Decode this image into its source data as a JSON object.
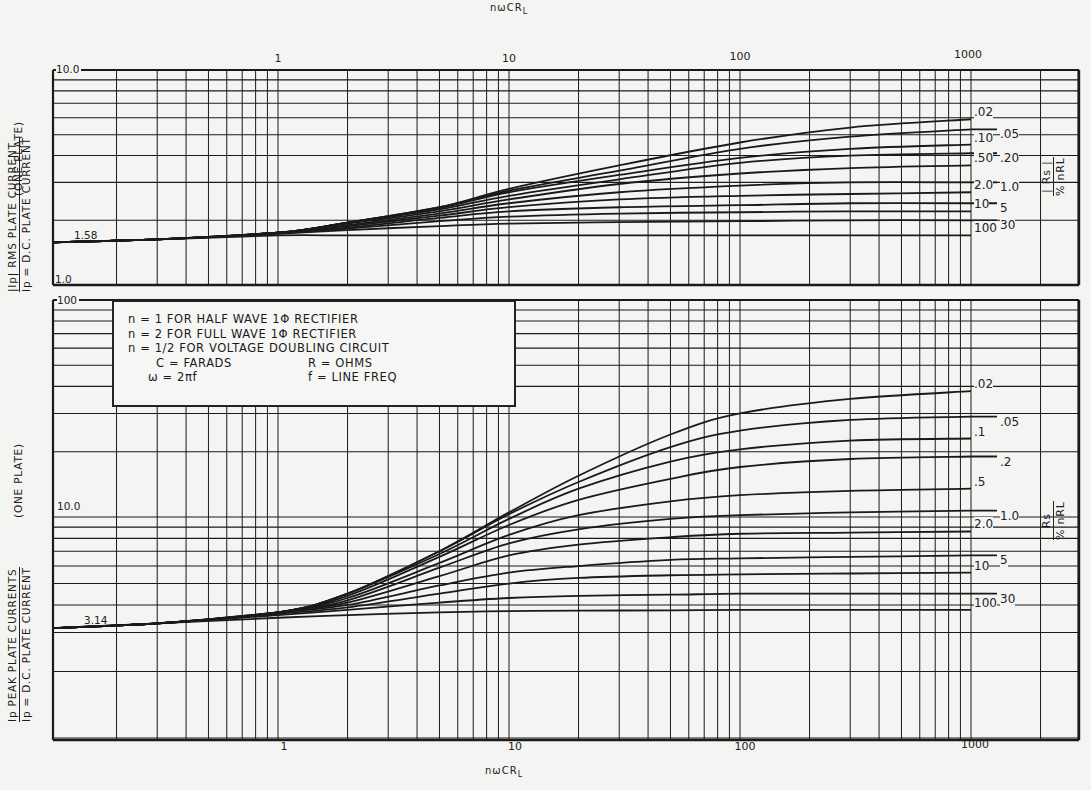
{
  "chart_data": [
    {
      "type": "line",
      "panel": "top",
      "title": "",
      "xlabel": "nωCR_L",
      "ylabel": "|Ip| / Ip = RMS PLATE CURRENT / D.C. PLATE CURRENT (ONE PLATE)",
      "xscale": "log",
      "yscale": "log",
      "xlim": [
        0.1,
        3000
      ],
      "ylim": [
        1.0,
        10.0
      ],
      "x_ticks": [
        "1",
        "10",
        "100",
        "1000"
      ],
      "y_tick_labels": [
        "10.0",
        "1.0"
      ],
      "annotations": [
        {
          "text": "1.58",
          "value": 1.58
        }
      ],
      "legend_title": "% |Rs| / nRL",
      "grid": true,
      "x": [
        0.1,
        0.3,
        1,
        2,
        5,
        10,
        30,
        100,
        300,
        1000
      ],
      "series": [
        {
          "name": ".02",
          "values": [
            1.58,
            1.63,
            1.75,
            1.95,
            2.3,
            2.8,
            3.6,
            4.6,
            5.4,
            5.9
          ]
        },
        {
          "name": ".05",
          "values": [
            1.58,
            1.63,
            1.75,
            1.95,
            2.3,
            2.75,
            3.4,
            4.3,
            4.9,
            5.3
          ]
        },
        {
          "name": ".10",
          "values": [
            1.58,
            1.63,
            1.75,
            1.95,
            2.28,
            2.7,
            3.25,
            3.9,
            4.3,
            4.5
          ]
        },
        {
          "name": ".20",
          "values": [
            1.58,
            1.63,
            1.75,
            1.95,
            2.25,
            2.6,
            3.1,
            3.7,
            4.0,
            4.1
          ]
        },
        {
          "name": ".50",
          "values": [
            1.58,
            1.63,
            1.75,
            1.93,
            2.2,
            2.5,
            2.95,
            3.3,
            3.5,
            3.6
          ]
        },
        {
          "name": "1.0",
          "values": [
            1.58,
            1.63,
            1.75,
            1.9,
            2.15,
            2.4,
            2.7,
            2.9,
            3.0,
            3.0
          ]
        },
        {
          "name": "2.0",
          "values": [
            1.58,
            1.63,
            1.75,
            1.88,
            2.1,
            2.3,
            2.5,
            2.6,
            2.65,
            2.7
          ]
        },
        {
          "name": "5",
          "values": [
            1.58,
            1.63,
            1.75,
            1.85,
            2.05,
            2.2,
            2.3,
            2.35,
            2.4,
            2.4
          ]
        },
        {
          "name": "10",
          "values": [
            1.58,
            1.63,
            1.75,
            1.83,
            1.98,
            2.08,
            2.15,
            2.18,
            2.2,
            2.2
          ]
        },
        {
          "name": "30",
          "values": [
            1.58,
            1.63,
            1.73,
            1.8,
            1.88,
            1.93,
            1.96,
            1.98,
            2.0,
            2.0
          ]
        },
        {
          "name": "100",
          "values": [
            1.58,
            1.63,
            1.7,
            1.7,
            1.7,
            1.7,
            1.7,
            1.7,
            1.7,
            1.7
          ]
        }
      ]
    },
    {
      "type": "line",
      "panel": "bottom",
      "title": "",
      "xlabel": "nωCR_L",
      "ylabel": "Ip / Ip = PEAK PLATE CURRENTS / D.C. PLATE CURRENT (ONE PLATE)",
      "xscale": "log",
      "yscale": "log",
      "xlim": [
        0.1,
        3000
      ],
      "ylim": [
        1.0,
        100
      ],
      "x_ticks": [
        "1",
        "10",
        "100",
        "1000"
      ],
      "y_tick_labels": [
        "100",
        "10.0"
      ],
      "annotations": [
        {
          "text": "3.14",
          "value": 3.14
        }
      ],
      "legend_title": "% Rs / nRL",
      "grid": true,
      "x": [
        0.1,
        0.3,
        1,
        2,
        5,
        10,
        20,
        50,
        100,
        300,
        1000
      ],
      "series": [
        {
          "name": ".02",
          "values": [
            3.14,
            3.3,
            3.7,
            4.5,
            7.0,
            10.5,
            15.5,
            24,
            30,
            35,
            38
          ]
        },
        {
          "name": ".05",
          "values": [
            3.14,
            3.3,
            3.7,
            4.5,
            7.0,
            10.3,
            14.5,
            21,
            25,
            28,
            29
          ]
        },
        {
          "name": ".1",
          "values": [
            3.14,
            3.3,
            3.7,
            4.5,
            6.8,
            9.8,
            13.5,
            18,
            20.5,
            22.5,
            23
          ]
        },
        {
          "name": ".2",
          "values": [
            3.14,
            3.3,
            3.7,
            4.4,
            6.6,
            9.2,
            12,
            15,
            17,
            18.5,
            19
          ]
        },
        {
          "name": ".5",
          "values": [
            3.14,
            3.3,
            3.7,
            4.3,
            6.2,
            8.3,
            10.2,
            11.8,
            12.6,
            13.2,
            13.5
          ]
        },
        {
          "name": "1.0",
          "values": [
            3.14,
            3.3,
            3.7,
            4.2,
            5.9,
            7.6,
            8.8,
            9.8,
            10.2,
            10.5,
            10.7
          ]
        },
        {
          "name": "2.0",
          "values": [
            3.14,
            3.3,
            3.7,
            4.1,
            5.4,
            6.7,
            7.5,
            8.1,
            8.4,
            8.5,
            8.6
          ]
        },
        {
          "name": "5",
          "values": [
            3.14,
            3.3,
            3.7,
            4.0,
            4.9,
            5.6,
            6.0,
            6.4,
            6.5,
            6.6,
            6.7
          ]
        },
        {
          "name": "10",
          "values": [
            3.14,
            3.3,
            3.65,
            3.9,
            4.5,
            5.0,
            5.3,
            5.45,
            5.5,
            5.55,
            5.6
          ]
        },
        {
          "name": "30",
          "values": [
            3.14,
            3.3,
            3.6,
            3.8,
            4.1,
            4.3,
            4.4,
            4.45,
            4.5,
            4.5,
            4.5
          ]
        },
        {
          "name": "100",
          "values": [
            3.14,
            3.3,
            3.5,
            3.6,
            3.7,
            3.75,
            3.77,
            3.78,
            3.8,
            3.8,
            3.8
          ]
        }
      ]
    }
  ],
  "axes": {
    "top_xlabel": "nωCR",
    "top_xlabel_sub": "L",
    "bottom_xlabel": "nωCR",
    "bottom_xlabel_sub": "L",
    "x_ticks": [
      {
        "label": "1",
        "value": 1
      },
      {
        "label": "10",
        "value": 10
      },
      {
        "label": "100",
        "value": 100
      },
      {
        "label": "1000",
        "value": 1000
      }
    ],
    "top_y": {
      "max_label": "10.0",
      "min_label": "1.0",
      "ref_label": "1.58"
    },
    "bottom_y": {
      "max_label": "100",
      "mid_label": "10.0",
      "ref_label": "3.14"
    },
    "top_ylabel_line1": "|Ip|   RMS PLATE CURRENT",
    "top_ylabel_line2": "Ip  =  D.C. PLATE CURRENT",
    "top_ylabel_suffix": "(ONE PLATE)",
    "bottom_ylabel_line1": "Ip    PEAK PLATE CURRENTS",
    "bottom_ylabel_line2": "Ip  =  D.C. PLATE CURRENT",
    "bottom_ylabel_suffix": "(ONE PLATE)",
    "top_param_num": "| Rs |",
    "top_param_den": "% nRL",
    "bottom_param_num": "Rs",
    "bottom_param_den": "% nRL"
  },
  "legend_box": {
    "line1": "n = 1 FOR HALF WAVE 1Φ  RECTIFIER",
    "line2": "n = 2 FOR FULL WAVE 1Φ  RECTIFIER",
    "line3": "n = 1/2 FOR VOLTAGE DOUBLING CIRCUIT",
    "line4a": "C = FARADS",
    "line4b": "R = OHMS",
    "line5a": "ω = 2πf",
    "line5b": "f = LINE FREQ"
  },
  "colors": {
    "ink": "#1a1a1a",
    "paper": "#f4f4f2",
    "grid": "#2a2a2a"
  }
}
